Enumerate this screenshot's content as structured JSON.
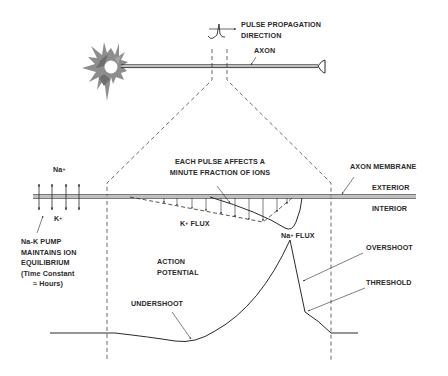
{
  "diagram": {
    "type": "neuron action potential schematic",
    "colors": {
      "line": "#2a2a2a",
      "soma_fill": "#8a8a8a",
      "soma_core": "#ffffff",
      "background": "#ffffff"
    },
    "labels": {
      "pulse_direction_line1": "PULSE PROPAGATION",
      "pulse_direction_line2": "DIRECTION",
      "axon": "AXON",
      "each_pulse_line1": "EACH PULSE AFFECTS A",
      "each_pulse_line2": "MINUTE FRACTION OF IONS",
      "axon_membrane": "AXON MEMBRANE",
      "exterior": "EXTERIOR",
      "interior": "INTERIOR",
      "na_ion": "Na",
      "k_ion": "K",
      "plus": "+",
      "k_flux": "FLUX",
      "na_flux": "FLUX",
      "pump_line1": "Na-K PUMP",
      "pump_line2": "MAINTAINS ION",
      "pump_line3": "EQUILIBRIUM",
      "pump_line4": "(Time Constant",
      "pump_line5": "≈ Hours)",
      "action_potential_line1": "ACTION",
      "action_potential_line2": "POTENTIAL",
      "overshoot": "OVERSHOOT",
      "threshold": "THRESHOLD",
      "undershoot": "UNDERSHOOT"
    },
    "icons": [
      "neuron-soma-icon",
      "axon-terminal-icon",
      "pulse-waveform-icon",
      "arrow-right-icon",
      "bidirectional-arrow-icon"
    ]
  }
}
